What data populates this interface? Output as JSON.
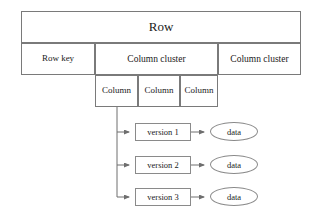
{
  "diagram": {
    "title": "Row",
    "table": {
      "header": {
        "label": "Row"
      },
      "second_row": {
        "row_key": {
          "label": "Row key"
        },
        "column_clusters": [
          {
            "label": "Column cluster"
          },
          {
            "label": "Column cluster"
          }
        ]
      },
      "third_row": {
        "columns": [
          {
            "label": "Column"
          },
          {
            "label": "Column"
          },
          {
            "label": "Column"
          }
        ]
      }
    },
    "versions": [
      {
        "label": "version 1",
        "data": {
          "label": "data"
        }
      },
      {
        "label": "version 2",
        "data": {
          "label": "data"
        }
      },
      {
        "label": "version 3",
        "data": {
          "label": "data"
        }
      }
    ],
    "colors": {
      "border": "#7a7a7a",
      "edge": "#6e6e6e",
      "text": "#1a1a1a",
      "background": "#ffffff"
    }
  }
}
